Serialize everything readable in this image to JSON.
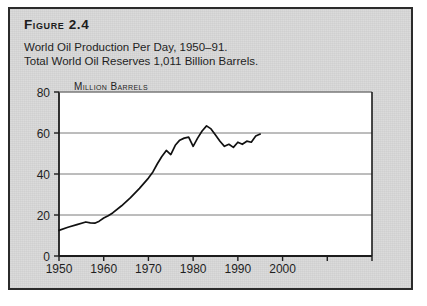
{
  "figure": {
    "label": "Figure 2.4",
    "subtitle_line1": "World Oil Production Per Day, 1950–91.",
    "subtitle_line2": "Total World Oil Reserves 1,011 Billion Barrels."
  },
  "colors": {
    "panel_background": "#d9d9d9",
    "panel_border": "#2b2b2b",
    "plot_background": "#ffffff",
    "gridline": "#7a7a7a",
    "axis": "#1c1c1c",
    "data_line": "#111111",
    "text": "#1f1f1f"
  },
  "chart_data": {
    "type": "line",
    "title": "World Oil Production Per Day, 1950–91.",
    "subtitle": "Total World Oil Reserves 1,011 Billion Barrels.",
    "xlabel": "",
    "ylabel": "Million Barrels",
    "ylim": [
      0,
      80
    ],
    "xlim": [
      1950,
      2020
    ],
    "grid": true,
    "legend": false,
    "yticks": [
      0,
      20,
      40,
      60,
      80
    ],
    "ytick_labels": [
      "0",
      "20",
      "40",
      "60",
      "80"
    ],
    "xticks": [
      1950,
      1960,
      1970,
      1980,
      1990,
      2000,
      2010,
      2020
    ],
    "xtick_labels": [
      "1950",
      "1960",
      "1970",
      "1980",
      "1990",
      "2000",
      "",
      ""
    ],
    "series": [
      {
        "name": "Million Barrels Per Day",
        "x": [
          1950,
          1952,
          1954,
          1956,
          1957,
          1958,
          1959,
          1960,
          1961,
          1962,
          1964,
          1966,
          1968,
          1970,
          1971,
          1972,
          1973,
          1974,
          1975,
          1976,
          1977,
          1978,
          1979,
          1980,
          1981,
          1982,
          1983,
          1984,
          1985,
          1986,
          1987,
          1988,
          1989,
          1990,
          1991,
          1992,
          1993,
          1994,
          1995
        ],
        "values": [
          12.5,
          14.0,
          15.3,
          16.6,
          16.2,
          16.0,
          17.0,
          18.5,
          19.6,
          21.0,
          24.5,
          28.5,
          33.0,
          38.0,
          41.0,
          45.0,
          48.5,
          51.5,
          49.5,
          54.0,
          56.5,
          57.5,
          58.0,
          53.5,
          57.5,
          61.0,
          63.5,
          62.0,
          59.0,
          56.0,
          53.5,
          54.5,
          53.0,
          55.5,
          54.5,
          56.0,
          55.5,
          58.5,
          59.5
        ]
      }
    ]
  }
}
